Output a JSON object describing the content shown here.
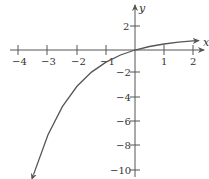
{
  "chart_data": {
    "type": "line",
    "title": "",
    "xlabel": "x",
    "ylabel": "y",
    "xlim": [
      -4.5,
      2.5
    ],
    "ylim": [
      -10.5,
      3.5
    ],
    "x_ticks": [
      -4,
      -3,
      -2,
      -1,
      1,
      2
    ],
    "y_ticks": [
      2,
      -2,
      -4,
      -6,
      -8,
      -10
    ],
    "x_tick_labels": [
      "−4",
      "−3",
      "−2",
      "−1",
      "1",
      "2"
    ],
    "y_tick_labels": [
      "2",
      "−2",
      "−4",
      "−6",
      "−8",
      "−10"
    ],
    "grid": false,
    "legend": null,
    "series": [
      {
        "name": "f(x) = 1 − 2^(−x)",
        "x": [
          -3.5,
          -3,
          -2.5,
          -2,
          -1.5,
          -1,
          -0.5,
          0,
          0.5,
          1,
          1.5,
          2,
          2.2
        ],
        "values": [
          -10.3,
          -7,
          -4.66,
          -3,
          -1.83,
          -1,
          -0.41,
          0,
          0.29,
          0.5,
          0.65,
          0.75,
          0.78
        ]
      }
    ],
    "colors": {
      "axis": "#555555",
      "curve": "#555555"
    }
  }
}
